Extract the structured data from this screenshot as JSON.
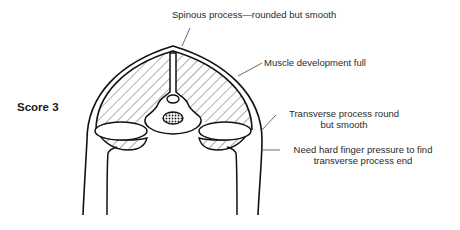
{
  "score": {
    "label": "Score 3"
  },
  "labels": {
    "spinous": "Spinous process—rounded but smooth",
    "muscle": "Muscle development full",
    "transverse_line1": "Transverse process round",
    "transverse_line2": "but smooth",
    "pressure_line1": "Need hard finger pressure to find",
    "pressure_line2": "transverse process end"
  },
  "colors": {
    "stroke": "#111111",
    "text": "#2a2a2a",
    "background": "#ffffff"
  }
}
